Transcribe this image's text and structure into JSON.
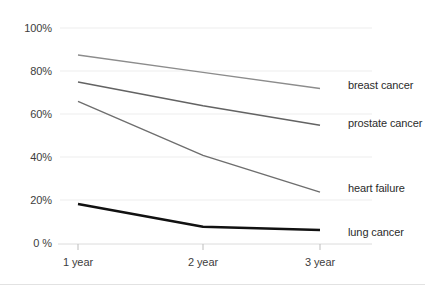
{
  "chart_data": {
    "type": "line",
    "title": "",
    "xlabel": "",
    "ylabel": "",
    "categories": [
      "1 year",
      "2 year",
      "3 year"
    ],
    "ylim": [
      0,
      100
    ],
    "yticks": [
      0,
      20,
      40,
      60,
      80,
      100
    ],
    "ytick_labels": [
      "0 %",
      "20%",
      "40%",
      "60%",
      "80%",
      "100%"
    ],
    "grid": true,
    "legend_position": "right-inline-end-of-line",
    "series": [
      {
        "name": "breast cancer",
        "values": [
          87.5,
          79.5,
          72
        ],
        "color": "#8c8c8c",
        "width": 1.3
      },
      {
        "name": "prostate cancer",
        "values": [
          75,
          64,
          55
        ],
        "color": "#636363",
        "width": 1.5
      },
      {
        "name": "heart failure",
        "values": [
          66,
          41,
          24
        ],
        "color": "#6e6e6e",
        "width": 1.4
      },
      {
        "name": "lung cancer",
        "values": [
          18.5,
          8,
          6.5
        ],
        "color": "#111111",
        "width": 2.6
      }
    ]
  },
  "axis": {
    "y_ticks": [
      {
        "label": "100%",
        "value": 100
      },
      {
        "label": "80%",
        "value": 80
      },
      {
        "label": "60%",
        "value": 60
      },
      {
        "label": "40%",
        "value": 40
      },
      {
        "label": "20%",
        "value": 20
      },
      {
        "label": "0 %",
        "value": 0
      }
    ],
    "x_ticks": [
      {
        "label": "1 year",
        "value": 1
      },
      {
        "label": "2 year",
        "value": 2
      },
      {
        "label": "3 year",
        "value": 3
      }
    ]
  },
  "legend": {
    "items": [
      {
        "label": "breast cancer"
      },
      {
        "label": "prostate cancer"
      },
      {
        "label": "heart failure"
      },
      {
        "label": "lung cancer"
      }
    ]
  },
  "colors": {
    "grid": "#ededed",
    "axis_text": "#3d3d3d",
    "background": "#ffffff"
  }
}
